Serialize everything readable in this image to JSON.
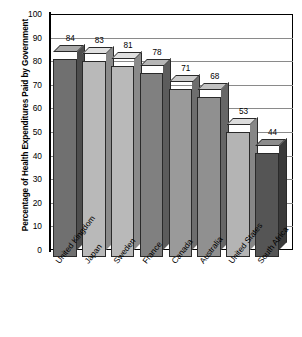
{
  "chart_data": {
    "type": "bar",
    "title": "",
    "subtitle": "",
    "xlabel": "",
    "ylabel": "Percentage of Health Expenditures Paid by Government",
    "ylim": [
      0,
      100
    ],
    "ytick_step": 10,
    "grid": true,
    "legend": false,
    "three_d": true,
    "categories": [
      "United Kingdom",
      "Japan",
      "Sweden",
      "France",
      "Canada",
      "Australia",
      "United States",
      "South Africa"
    ],
    "values": [
      84,
      83,
      81,
      78,
      71,
      68,
      53,
      44
    ],
    "value_labels": [
      "84",
      "83",
      "81",
      "78",
      "71",
      "68",
      "53",
      "44"
    ],
    "ytick_labels": [
      "100",
      "90",
      "80",
      "70",
      "60",
      "50",
      "40",
      "30",
      "20",
      "10",
      "0"
    ],
    "ytick_values": [
      100,
      90,
      80,
      70,
      60,
      50,
      40,
      30,
      20,
      10,
      0
    ],
    "bar_colors": [
      "#707070",
      "#b9b9b9",
      "#b9b9b9",
      "#808080",
      "#9a9a9a",
      "#909090",
      "#b4b4b4",
      "#555555"
    ],
    "bar_top_colors": [
      "#a8a8a8",
      "#e0e0e0",
      "#e0e0e0",
      "#b6b6b6",
      "#cacaca",
      "#c2c2c2",
      "#dcdcdc",
      "#8c8c8c"
    ],
    "bar_side_colors": [
      "#4d4d4d",
      "#8a8a8a",
      "#8a8a8a",
      "#5c5c5c",
      "#6e6e6e",
      "#666666",
      "#868686",
      "#3a3a3a"
    ]
  },
  "colors": {
    "axis": "#000000",
    "grid": "#8a8a8a",
    "background": "#ffffff",
    "text": "#000000"
  }
}
